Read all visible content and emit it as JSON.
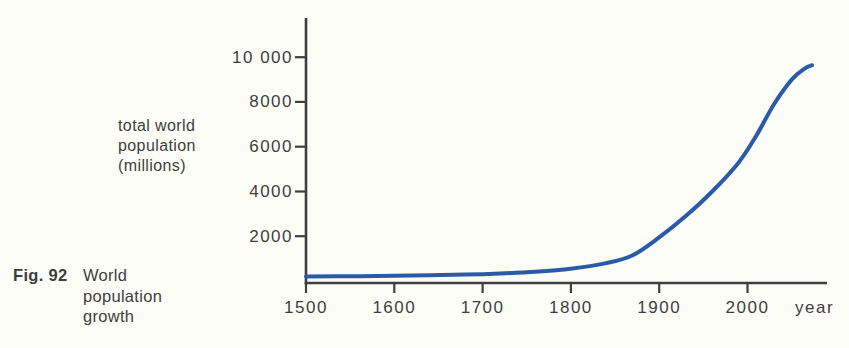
{
  "figure": {
    "caption_prefix": "Fig. 92",
    "caption_lines": [
      "World",
      "population",
      "growth"
    ],
    "y_axis_title_lines": [
      "total world",
      "population",
      "(millions)"
    ],
    "x_axis_unit": "year"
  },
  "colors": {
    "curve": "#2b5aa9",
    "axis": "#3f3f3f",
    "text": "#3d3d3d",
    "background": "#fdfdf8"
  },
  "chart_data": {
    "type": "line",
    "title": "World population growth",
    "xlabel": "year",
    "ylabel": "total world population (millions)",
    "grid": false,
    "legend": "none",
    "xlim": [
      1500,
      2090
    ],
    "ylim": [
      0,
      11750
    ],
    "x_ticks": [
      1500,
      1600,
      1700,
      1800,
      1900,
      2000
    ],
    "x_tick_labels": [
      "1500",
      "1600",
      "1700",
      "1800",
      "1900",
      "2000"
    ],
    "y_ticks": [
      2000,
      4000,
      6000,
      8000,
      10000
    ],
    "y_tick_labels": [
      "2000",
      "4000",
      "6000",
      "8000",
      "10 000"
    ],
    "series": [
      {
        "name": "total world population (millions)",
        "points": [
          [
            1500,
            200
          ],
          [
            1560,
            215
          ],
          [
            1620,
            240
          ],
          [
            1680,
            285
          ],
          [
            1720,
            335
          ],
          [
            1760,
            415
          ],
          [
            1800,
            550
          ],
          [
            1840,
            800
          ],
          [
            1870,
            1150
          ],
          [
            1900,
            1950
          ],
          [
            1930,
            2900
          ],
          [
            1960,
            4000
          ],
          [
            1990,
            5300
          ],
          [
            2010,
            6500
          ],
          [
            2030,
            7900
          ],
          [
            2050,
            9000
          ],
          [
            2065,
            9500
          ],
          [
            2073,
            9640
          ]
        ]
      }
    ]
  }
}
